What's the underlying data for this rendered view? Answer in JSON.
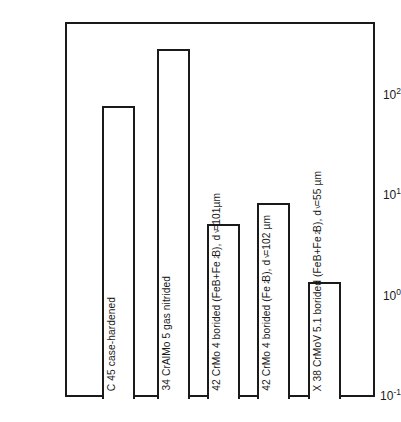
{
  "chart_data": {
    "type": "bar",
    "title": "",
    "subtitle": "",
    "xlabel": "",
    "ylabel": "Linear wear, µm",
    "yscale": "log",
    "ylim": [
      0.1,
      1000
    ],
    "grid": false,
    "legend": null,
    "categories": [
      "C 45 case-hardened",
      "34 CrAlMo 5  gas nitrided",
      "42 CrMo 4 borided (FeB+Fe2B), dv=101µm",
      "42 CrMo 4 borided (Fe2B), dv=102 µm",
      "X 38 CrMoV 5.1 borided (FeB+Fe2B), dv=55 µm"
    ],
    "values": [
      83,
      310,
      5.5,
      8.9,
      1.45
    ],
    "yticks": [
      {
        "value": 100,
        "mantissa": "10",
        "exponent": "2"
      },
      {
        "value": 10,
        "mantissa": "10",
        "exponent": "1"
      },
      {
        "value": 1,
        "mantissa": "10",
        "exponent": "0"
      },
      {
        "value": 0.1,
        "mantissa": "10",
        "exponent": "-1"
      }
    ],
    "bars": [
      {
        "id": "bar-1",
        "value": 83,
        "label_parts": [
          {
            "text": "C 45 case-hardened",
            "sub": ""
          }
        ],
        "label_plain": "C 45 case-hardened"
      },
      {
        "id": "bar-2",
        "value": 310,
        "label_parts": [
          {
            "text": "34 CrAlMo 5  gas nitrided",
            "sub": ""
          }
        ],
        "label_plain": "34 CrAlMo 5  gas nitrided"
      },
      {
        "id": "bar-3",
        "value": 5.5,
        "label_parts": [
          {
            "text": "42 CrMo 4 borided (FeB+Fe",
            "sub": "2"
          },
          {
            "text": "B), d",
            "sub": "v"
          },
          {
            "text": "=101µm",
            "sub": ""
          }
        ],
        "label_plain": "42 CrMo 4 borided (FeB+Fe2B), dv=101µm"
      },
      {
        "id": "bar-4",
        "value": 8.9,
        "label_parts": [
          {
            "text": "42 CrMo 4 borided (Fe",
            "sub": "2"
          },
          {
            "text": "B), d",
            "sub": "v"
          },
          {
            "text": "=102 µm",
            "sub": ""
          }
        ],
        "label_plain": "42 CrMo 4 borided (Fe2B), dv=102 µm"
      },
      {
        "id": "bar-5",
        "value": 1.45,
        "label_parts": [
          {
            "text": "X 38 CrMoV 5.1 borided (FeB+Fe",
            "sub": "2"
          },
          {
            "text": "B), d",
            "sub": "v"
          },
          {
            "text": "=55 µm",
            "sub": ""
          }
        ],
        "label_plain": "X 38 CrMoV 5.1 borided (FeB+Fe2B), dv=55 µm"
      }
    ],
    "colors": {
      "ink": "#1a1a1a",
      "background": "#ffffff",
      "bar_fill": "#ffffff",
      "bar_stroke": "#1a1a1a"
    }
  }
}
